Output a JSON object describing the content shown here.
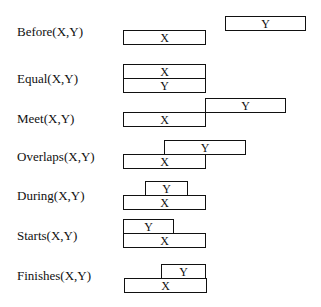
{
  "relations": [
    {
      "label": "Before(X,Y)",
      "label_y": 24,
      "boxes": [
        {
          "name": "Y",
          "x": 225,
          "y": 16,
          "w": 81
        },
        {
          "name": "X",
          "x": 123,
          "y": 30,
          "w": 83
        }
      ]
    },
    {
      "label": "Equal(X,Y)",
      "label_y": 71,
      "boxes": [
        {
          "name": "X",
          "x": 123,
          "y": 64,
          "w": 83
        },
        {
          "name": "Y",
          "x": 123,
          "y": 78,
          "w": 83
        }
      ]
    },
    {
      "label": "Meet(X,Y)",
      "label_y": 111,
      "boxes": [
        {
          "name": "Y",
          "x": 205,
          "y": 98,
          "w": 81
        },
        {
          "name": "X",
          "x": 123,
          "y": 112,
          "w": 83
        }
      ]
    },
    {
      "label": "Overlaps(X,Y)",
      "label_y": 149,
      "boxes": [
        {
          "name": "Y",
          "x": 164,
          "y": 140,
          "w": 82
        },
        {
          "name": "X",
          "x": 123,
          "y": 154,
          "w": 83
        }
      ]
    },
    {
      "label": "During(X,Y)",
      "label_y": 188,
      "boxes": [
        {
          "name": "Y",
          "x": 145,
          "y": 181,
          "w": 43
        },
        {
          "name": "X",
          "x": 123,
          "y": 195,
          "w": 83
        }
      ]
    },
    {
      "label": "Starts(X,Y)",
      "label_y": 228,
      "boxes": [
        {
          "name": "Y",
          "x": 123,
          "y": 219,
          "w": 51
        },
        {
          "name": "X",
          "x": 123,
          "y": 233,
          "w": 83
        }
      ]
    },
    {
      "label": "Finishes(X,Y)",
      "label_y": 268,
      "boxes": [
        {
          "name": "Y",
          "x": 161,
          "y": 264,
          "w": 45
        },
        {
          "name": "X",
          "x": 124,
          "y": 278,
          "w": 83
        }
      ]
    }
  ]
}
